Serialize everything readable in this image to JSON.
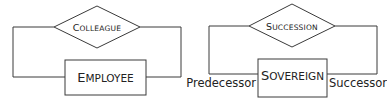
{
  "diagrams": [
    {
      "relationship": {
        "label_initial": "C",
        "label_rest": "OLLEAGUE",
        "label": "Colleague"
      },
      "entity": {
        "label_initial": "E",
        "label_rest": "MPLOYEE",
        "label": "Employee"
      },
      "roles": []
    },
    {
      "relationship": {
        "label_initial": "S",
        "label_rest": "UCCESSION",
        "label": "Succession"
      },
      "entity": {
        "label_initial": "S",
        "label_rest": "OVEREIGN",
        "label": "Sovereign"
      },
      "roles": [
        {
          "label": "Predecessor",
          "side": "left"
        },
        {
          "label": "Successor",
          "side": "right"
        }
      ]
    }
  ],
  "colors": {
    "stroke": "#3a3a3a",
    "text": "#222222",
    "background": "#ffffff"
  }
}
